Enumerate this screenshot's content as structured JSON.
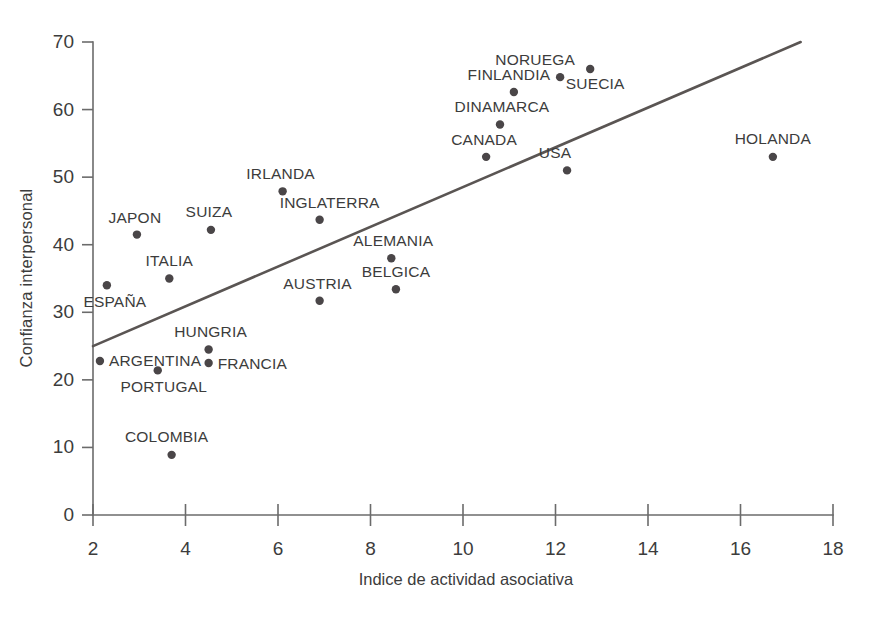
{
  "chart_data": {
    "type": "scatter",
    "title": "",
    "xlabel": "Indice de actividad asociativa",
    "ylabel": "Confianza interpersonal",
    "xlim": [
      2,
      18
    ],
    "ylim": [
      0,
      70
    ],
    "xticks": [
      2,
      4,
      6,
      8,
      10,
      12,
      14,
      16,
      18
    ],
    "yticks": [
      0,
      10,
      20,
      30,
      40,
      50,
      60,
      70
    ],
    "xtick_labels": [
      "2",
      "4",
      "6",
      "8",
      "10",
      "12",
      "14",
      "16",
      "18"
    ],
    "ytick_labels": [
      "0",
      "10",
      "20",
      "30",
      "40",
      "50",
      "60",
      "70"
    ],
    "grid": false,
    "legend": "none",
    "marker_color": "#4a4648",
    "line_color": "#5a5553",
    "axis_color": "#6b6b6b",
    "trendline": {
      "x": [
        2.0,
        17.3
      ],
      "y": [
        25.0,
        70.0
      ],
      "label": ""
    },
    "points": [
      {
        "label": "ESPANA",
        "display_label": "ESPAÑA",
        "x": 2.3,
        "y": 34.0,
        "label_pos": "below",
        "label_dx": 8,
        "label_dy": 22,
        "anchor": "mid"
      },
      {
        "label": "ARGENTINA",
        "display_label": "ARGENTINA",
        "x": 2.15,
        "y": 22.8,
        "label_pos": "right",
        "label_dx": 9,
        "label_dy": 5,
        "anchor": "start"
      },
      {
        "label": "JAPON",
        "display_label": "JAPON",
        "x": 2.95,
        "y": 41.5,
        "label_pos": "above",
        "label_dx": -2,
        "label_dy": -12,
        "anchor": "mid"
      },
      {
        "label": "PORTUGAL",
        "display_label": "PORTUGAL",
        "x": 3.4,
        "y": 21.4,
        "label_pos": "below",
        "label_dx": 6,
        "label_dy": 22,
        "anchor": "mid"
      },
      {
        "label": "COLOMBIA",
        "display_label": "COLOMBIA",
        "x": 3.7,
        "y": 8.9,
        "label_pos": "above-left",
        "label_dx": -5,
        "label_dy": -13,
        "anchor": "mid"
      },
      {
        "label": "ITALIA",
        "display_label": "ITALIA",
        "x": 3.65,
        "y": 35.0,
        "label_pos": "above",
        "label_dx": 0,
        "label_dy": -13,
        "anchor": "mid"
      },
      {
        "label": "SUIZA",
        "display_label": "SUIZA",
        "x": 4.55,
        "y": 42.2,
        "label_pos": "above",
        "label_dx": -2,
        "label_dy": -13,
        "anchor": "mid"
      },
      {
        "label": "HUNGRIA",
        "display_label": "HUNGRIA",
        "x": 4.5,
        "y": 24.5,
        "label_pos": "above",
        "label_dx": 2,
        "label_dy": -12,
        "anchor": "mid"
      },
      {
        "label": "FRANCIA",
        "display_label": "FRANCIA",
        "x": 4.5,
        "y": 22.5,
        "label_pos": "right",
        "label_dx": 9,
        "label_dy": 6,
        "anchor": "start"
      },
      {
        "label": "IRLANDA",
        "display_label": "IRLANDA",
        "x": 6.1,
        "y": 47.9,
        "label_pos": "above",
        "label_dx": -2,
        "label_dy": -12,
        "anchor": "mid"
      },
      {
        "label": "AUSTRIA",
        "display_label": "AUSTRIA",
        "x": 6.9,
        "y": 31.7,
        "label_pos": "above",
        "label_dx": -2,
        "label_dy": -12,
        "anchor": "mid"
      },
      {
        "label": "INGLATERRA",
        "display_label": "INGLATERRA",
        "x": 6.9,
        "y": 43.7,
        "label_pos": "above",
        "label_dx": 10,
        "label_dy": -12,
        "anchor": "mid"
      },
      {
        "label": "ALEMANIA",
        "display_label": "ALEMANIA",
        "x": 8.45,
        "y": 38.0,
        "label_pos": "above",
        "label_dx": 2,
        "label_dy": -12,
        "anchor": "mid"
      },
      {
        "label": "BELGICA",
        "display_label": "BELGICA",
        "x": 8.55,
        "y": 33.4,
        "label_pos": "above",
        "label_dx": 0,
        "label_dy": -12,
        "anchor": "mid"
      },
      {
        "label": "CANADA",
        "display_label": "CANADA",
        "x": 10.5,
        "y": 53.0,
        "label_pos": "above",
        "label_dx": -2,
        "label_dy": -12,
        "anchor": "mid"
      },
      {
        "label": "DINAMARCA",
        "display_label": "DINAMARCA",
        "x": 10.8,
        "y": 57.8,
        "label_pos": "above",
        "label_dx": 2,
        "label_dy": -12,
        "anchor": "mid"
      },
      {
        "label": "FINLANDIA",
        "display_label": "FINLANDIA",
        "x": 11.1,
        "y": 62.6,
        "label_pos": "above",
        "label_dx": -5,
        "label_dy": -12,
        "anchor": "mid"
      },
      {
        "label": "NORUEGA",
        "display_label": "NORUEGA",
        "x": 12.1,
        "y": 64.8,
        "label_pos": "above-left",
        "label_dx": -25,
        "label_dy": -12,
        "anchor": "mid"
      },
      {
        "label": "SUECIA",
        "display_label": "SUECIA",
        "x": 12.75,
        "y": 66.0,
        "label_pos": "below-right",
        "label_dx": 5,
        "label_dy": 20,
        "anchor": "mid"
      },
      {
        "label": "USA",
        "display_label": "USA",
        "x": 12.25,
        "y": 51.0,
        "label_pos": "above-left",
        "label_dx": -12,
        "label_dy": -12,
        "anchor": "mid"
      },
      {
        "label": "HOLANDA",
        "display_label": "HOLANDA",
        "x": 16.7,
        "y": 53.0,
        "label_pos": "above",
        "label_dx": 0,
        "label_dy": -13,
        "anchor": "mid"
      }
    ]
  }
}
